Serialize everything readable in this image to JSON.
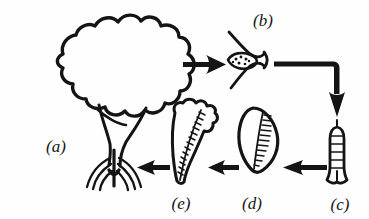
{
  "figure": {
    "background_color": "#fefefe",
    "ink_color": "#141414",
    "width": 369,
    "height": 219
  },
  "labels": {
    "a": "(a)",
    "b": "(b)",
    "c": "(c)",
    "d": "(d)",
    "e": "(e)"
  },
  "stages": [
    {
      "key": "a",
      "label": "(a)",
      "name": "mature-tree",
      "description": "Mature tree with lobed cloud-like canopy, forked trunk and spreading prop roots",
      "label_x": 56,
      "label_y": 148
    },
    {
      "key": "b",
      "label": "(b)",
      "name": "flower-fruit",
      "description": "Flower or fruit with two curved bracts enclosing a stippled ovoid centre",
      "label_x": 263,
      "label_y": 22
    },
    {
      "key": "c",
      "label": "(c)",
      "name": "propagule",
      "description": "Slender elongated propagule with horizontal cross-bars and a flared base",
      "label_x": 340,
      "label_y": 206
    },
    {
      "key": "d",
      "label": "(d)",
      "name": "seed-teardrop",
      "description": "Teardrop leaf-like seed with hatching along the inner right margin",
      "label_x": 252,
      "label_y": 205
    },
    {
      "key": "e",
      "label": "(e)",
      "name": "young-seedling",
      "description": "Irregular lumpy young seedling, broad and notched at top, tapering to a point, with diagonal hatching",
      "label_x": 181,
      "label_y": 205
    }
  ],
  "arrows": [
    {
      "name": "arrow-a-to-b",
      "from": "a",
      "to": "b",
      "direction": "right",
      "kind": "straight"
    },
    {
      "name": "arrow-b-to-c",
      "from": "b",
      "to": "c",
      "direction": "right-then-down",
      "kind": "elbow"
    },
    {
      "name": "arrow-c-to-d",
      "from": "c",
      "to": "d",
      "direction": "left",
      "kind": "straight"
    },
    {
      "name": "arrow-d-to-e",
      "from": "d",
      "to": "e",
      "direction": "left",
      "kind": "straight"
    },
    {
      "name": "arrow-e-to-a",
      "from": "e",
      "to": "a",
      "direction": "left",
      "kind": "straight"
    }
  ]
}
